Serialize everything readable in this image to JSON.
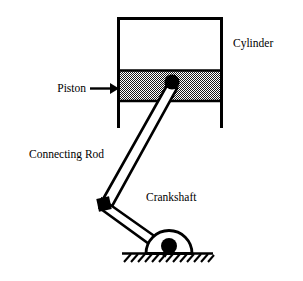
{
  "diagram": {
    "type": "mechanical-schematic",
    "background_color": "#ffffff",
    "line_color": "#000000",
    "fill_white": "#ffffff",
    "hatch_color": "#000000",
    "labels": {
      "cylinder": "Cylinder",
      "piston": "Piston",
      "connecting_rod": "Connecting Rod",
      "crankshaft": "Crankshaft"
    },
    "components": {
      "cylinder": {
        "name": "Cylinder",
        "left_wall_x": 118,
        "right_wall_x": 222,
        "top_y": 18,
        "bottom_y": 128,
        "open_bottom": true
      },
      "piston": {
        "name": "Piston",
        "top_y": 70,
        "bottom_y": 101,
        "fill_pattern": "checker-50"
      },
      "wrist_pin": {
        "name": "Wrist Pin",
        "cx": 172,
        "cy": 82,
        "r": 7.5,
        "shape": "filled-circle"
      },
      "crank_pin": {
        "name": "Crank Pin",
        "cx": 104,
        "cy": 204,
        "size": 13,
        "shape": "filled-square"
      },
      "main_bearing": {
        "name": "Main Bearing",
        "cx": 169,
        "cy": 253,
        "r": 23,
        "shape": "semicircle",
        "hub_r": 8
      },
      "ground": {
        "name": "Ground",
        "y": 253,
        "x_start": 122,
        "x_end": 213,
        "hatch_count": 13
      }
    },
    "annotations": {
      "piston_arrow": {
        "from_x": 90,
        "to_x": 118,
        "y": 89,
        "style": "solid-arrow-right"
      }
    }
  }
}
